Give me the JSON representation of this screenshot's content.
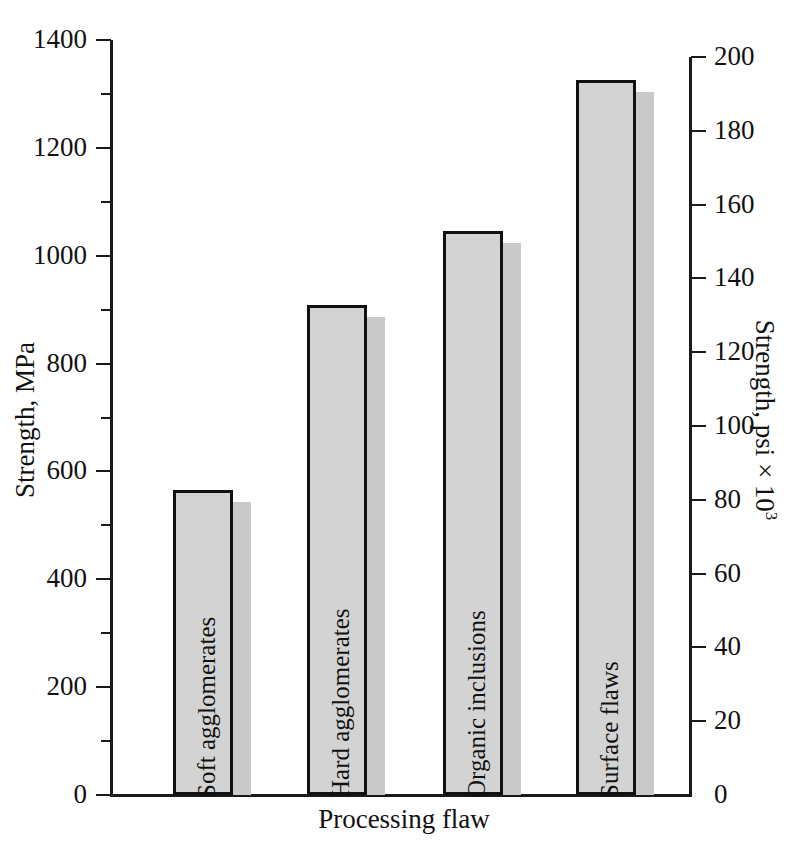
{
  "chart_data": {
    "type": "bar",
    "title": "",
    "xlabel": "Processing flaw",
    "ylabel": "Strength, MPa",
    "ylabel_right": "Strength, psi × 10",
    "ylabel_right_exponent": "3",
    "categories": [
      "Soft agglomerates",
      "Hard agglomerates",
      "Organic inclusions",
      "Surface flaws"
    ],
    "values": [
      565,
      908,
      1045,
      1325
    ],
    "values_right_psi_x1000": [
      82,
      132,
      152,
      192
    ],
    "ylim": [
      0,
      1400
    ],
    "ylim_right": [
      0,
      200
    ],
    "yticks": [
      0,
      200,
      400,
      600,
      800,
      1000,
      1200,
      1400
    ],
    "yticks_minor": [
      100,
      300,
      500,
      700,
      900,
      1100,
      1300
    ],
    "yticks_right": [
      0,
      20,
      40,
      60,
      80,
      100,
      120,
      140,
      160,
      180,
      200
    ],
    "grid": false,
    "legend": false,
    "bar_fill_color": "#d3d3d3",
    "bar_edge_color": "#111111",
    "bar_shadow_color": "#c9c9c9",
    "axis_color": "#1a1a1a",
    "background_color": "#ffffff"
  },
  "axis_left": {
    "title": "Strength, MPa",
    "ticks": [
      {
        "label": "1400",
        "value": 1400
      },
      {
        "label": "1200",
        "value": 1200
      },
      {
        "label": "1000",
        "value": 1000
      },
      {
        "label": "800",
        "value": 800
      },
      {
        "label": "600",
        "value": 600
      },
      {
        "label": "400",
        "value": 400
      },
      {
        "label": "200",
        "value": 200
      },
      {
        "label": "0",
        "value": 0
      }
    ]
  },
  "axis_right": {
    "title_main": "Strength, psi × 10",
    "title_exponent": "3",
    "ticks": [
      {
        "label": "200",
        "value": 200
      },
      {
        "label": "180",
        "value": 180
      },
      {
        "label": "160",
        "value": 160
      },
      {
        "label": "140",
        "value": 140
      },
      {
        "label": "120",
        "value": 120
      },
      {
        "label": "100",
        "value": 100
      },
      {
        "label": "80",
        "value": 80
      },
      {
        "label": "60",
        "value": 60
      },
      {
        "label": "40",
        "value": 40
      },
      {
        "label": "20",
        "value": 20
      },
      {
        "label": "0",
        "value": 0
      }
    ]
  },
  "axis_bottom": {
    "title": "Processing flaw"
  },
  "bars": [
    {
      "label": "Soft agglomerates",
      "value": 565
    },
    {
      "label": "Hard agglomerates",
      "value": 908
    },
    {
      "label": "Organic inclusions",
      "value": 1045
    },
    {
      "label": "Surface flaws",
      "value": 1325
    }
  ]
}
